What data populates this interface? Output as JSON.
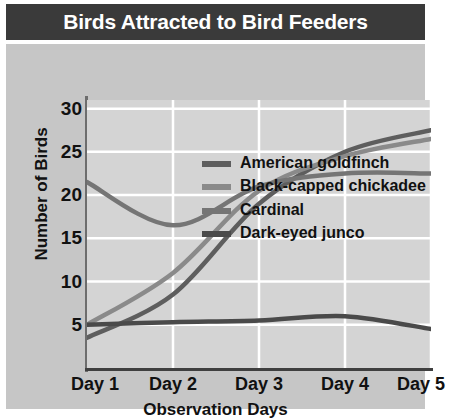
{
  "chart_data": {
    "type": "line",
    "title": "Birds Attracted to Bird Feeders",
    "xlabel": "Observation Days",
    "ylabel": "Number of Birds",
    "categories": [
      "Day 1",
      "Day 2",
      "Day 3",
      "Day 4",
      "Day 5"
    ],
    "x": [
      1,
      2,
      3,
      4,
      5
    ],
    "xlim": [
      1,
      5
    ],
    "ylim": [
      0,
      31
    ],
    "yticks": [
      5,
      10,
      15,
      20,
      25,
      30
    ],
    "ytick_labels": [
      "5",
      "10",
      "15",
      "20",
      "25",
      "30"
    ],
    "grid": true,
    "grid_color": "#ffffff",
    "legend_position": "center-right-inside",
    "plot_background": "#d4d4d4",
    "panel_background": "#c6c6c6",
    "title_background": "#3a3a3a",
    "title_color": "#ffffff",
    "series": [
      {
        "name": "American goldfinch",
        "color": "#5e5e5e",
        "values": [
          3.5,
          8.5,
          19.0,
          25.0,
          27.5
        ]
      },
      {
        "name": "Black-capped chickadee",
        "color": "#8a8a8a",
        "values": [
          5.0,
          11.0,
          20.5,
          24.5,
          26.5
        ]
      },
      {
        "name": "Cardinal",
        "color": "#757575",
        "values": [
          21.5,
          16.5,
          21.0,
          22.5,
          22.5
        ]
      },
      {
        "name": "Dark-eyed junco",
        "color": "#4a4a4a",
        "values": [
          5.0,
          5.3,
          5.5,
          6.0,
          4.5
        ]
      }
    ]
  },
  "legend": {
    "entries": [
      {
        "label": "American goldfinch",
        "color": "#5e5e5e"
      },
      {
        "label": "Black-capped chickadee",
        "color": "#8a8a8a"
      },
      {
        "label": "Cardinal",
        "color": "#757575"
      },
      {
        "label": "Dark-eyed junco",
        "color": "#4a4a4a"
      }
    ]
  }
}
